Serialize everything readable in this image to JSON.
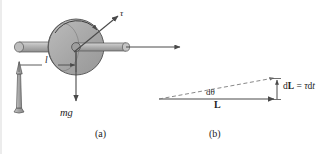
{
  "figure": {
    "background_color": "#ffffff",
    "ink_color": "#3a3a3a",
    "metal_fill": "#b0b0b0",
    "disc_fill": "#a8a8a8",
    "panels": [
      {
        "id": "a",
        "caption": "(a)",
        "description": "Spinning wheel on a pivot stand"
      },
      {
        "id": "b",
        "caption": "(b)",
        "description": "Angular momentum vector triangle"
      }
    ]
  },
  "panel_a": {
    "caption": "(a)",
    "labels": {
      "torque": "τ",
      "lever_arm": "l",
      "weight": "mg"
    },
    "parts": {
      "stand": "support-stand",
      "axle": "horizontal-axle",
      "disc": "spinning-disc",
      "spin_arrow": "curved-spin-arrow",
      "torque_arrow": "torque-vector-arrow",
      "weight_arrow": "weight-vector-arrow",
      "lever_arrow": "lever-arm-arrow",
      "axis_arrow": "angular-momentum-axis-arrow"
    }
  },
  "panel_b": {
    "caption": "(b)",
    "labels": {
      "dtheta": "dθ",
      "L": "L",
      "dL_prefix": "d",
      "dL_bold": "L",
      "equals": " = ",
      "tau": "τ",
      "dt_d": "d",
      "dt_t": "t",
      "dL_full": "dL = τdt"
    },
    "geometry": {
      "apex_x": 159,
      "apex_y": 99,
      "base_end_x": 277,
      "base_end_y": 99,
      "top_end_x": 277,
      "top_end_y": 78
    }
  }
}
